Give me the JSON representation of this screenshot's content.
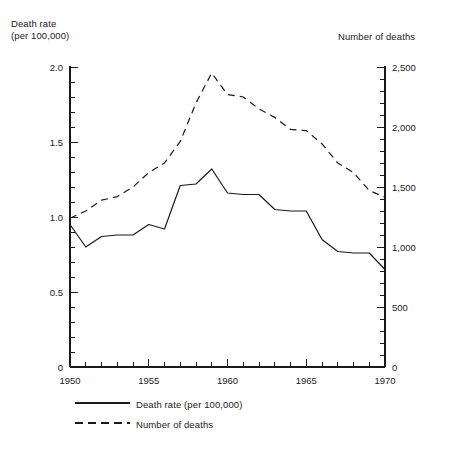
{
  "left_axis": {
    "title_line1": "Death rate",
    "title_line2": "(per 100,000)",
    "ticks": [
      "0",
      "0.5",
      "1.0",
      "1.5",
      "2.0"
    ]
  },
  "right_axis": {
    "title": "Number of deaths",
    "ticks": [
      "0",
      "500",
      "1,000",
      "1,500",
      "2,000",
      "2,500"
    ]
  },
  "x_axis": {
    "ticks": [
      "1950",
      "1955",
      "1960",
      "1965",
      "1970"
    ]
  },
  "legend": {
    "items": [
      {
        "label": "Death rate (per 100,000)",
        "style": "solid"
      },
      {
        "label": "Number of deaths",
        "style": "dashed"
      }
    ]
  },
  "colors": {
    "line": "#1a1a1a",
    "axis": "#1a1a1a",
    "background": "#ffffff"
  },
  "chart_data": {
    "type": "line",
    "title": "",
    "subtitle": "",
    "xlabel": "",
    "ylabel": "Death rate (per 100,000)",
    "y2label": "Number of deaths",
    "xlim": [
      1950,
      1970
    ],
    "ylim": [
      0,
      2.0
    ],
    "y2lim": [
      0,
      2500
    ],
    "grid": false,
    "legend_position": "bottom-left",
    "x": [
      1950,
      1951,
      1952,
      1953,
      1954,
      1955,
      1956,
      1957,
      1958,
      1959,
      1960,
      1961,
      1962,
      1963,
      1964,
      1965,
      1966,
      1967,
      1968,
      1969,
      1970
    ],
    "series": [
      {
        "name": "Death rate (per 100,000)",
        "axis": "left",
        "style": "solid",
        "units": "per 100,000",
        "values": [
          0.95,
          0.8,
          0.87,
          0.88,
          0.88,
          0.95,
          0.92,
          1.21,
          1.22,
          1.32,
          1.16,
          1.15,
          1.15,
          1.05,
          1.04,
          1.04,
          0.85,
          0.77,
          0.76,
          0.76,
          0.65
        ]
      },
      {
        "name": "Number of deaths",
        "axis": "right",
        "style": "dashed",
        "units": "deaths",
        "values": [
          1240,
          1300,
          1390,
          1420,
          1500,
          1620,
          1700,
          1880,
          2200,
          2450,
          2270,
          2250,
          2150,
          2080,
          1980,
          1970,
          1860,
          1700,
          1620,
          1470,
          1415
        ]
      }
    ]
  }
}
